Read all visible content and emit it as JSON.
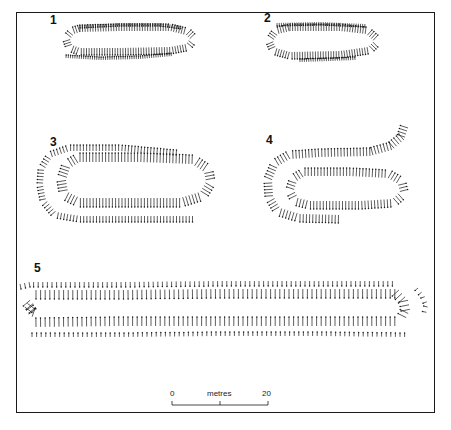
{
  "figures": [
    {
      "label": "1",
      "label_pos": [
        50,
        14
      ]
    },
    {
      "label": "2",
      "label_pos": [
        264,
        12
      ]
    },
    {
      "label": "3",
      "label_pos": [
        50,
        136
      ]
    },
    {
      "label": "4",
      "label_pos": [
        266,
        134
      ]
    },
    {
      "label": "5",
      "label_pos": [
        34,
        262
      ]
    }
  ],
  "scale_bar": {
    "unit_label": "metres",
    "start_label": "0",
    "end_label": "20",
    "x_start": 172,
    "x_end": 268,
    "y": 405
  },
  "stake_rows": [
    {
      "fig": "1",
      "pts": [
        [
          80,
          25
        ],
        [
          120,
          23
        ],
        [
          160,
          23
        ],
        [
          182,
          26
        ]
      ],
      "len": 3,
      "spacing": 2.2,
      "side": 1
    },
    {
      "fig": "1",
      "pts": [
        [
          80,
          32
        ],
        [
          120,
          31
        ],
        [
          170,
          31
        ],
        [
          186,
          35
        ],
        [
          190,
          39
        ],
        [
          186,
          44
        ],
        [
          170,
          47
        ],
        [
          120,
          48
        ],
        [
          80,
          48
        ],
        [
          72,
          45
        ],
        [
          70,
          39
        ],
        [
          74,
          34
        ],
        [
          80,
          32
        ]
      ],
      "len": 7,
      "spacing": 2.6,
      "side": -1
    },
    {
      "fig": "1",
      "pts": [
        [
          66,
          58
        ],
        [
          100,
          60
        ],
        [
          140,
          59
        ],
        [
          172,
          56
        ]
      ],
      "len": 3,
      "spacing": 2.2,
      "side": -1
    },
    {
      "fig": "2",
      "pts": [
        [
          277,
          23
        ],
        [
          320,
          22
        ],
        [
          366,
          24
        ]
      ],
      "len": 3,
      "spacing": 2.2,
      "side": 1
    },
    {
      "fig": "2",
      "pts": [
        [
          290,
          31
        ],
        [
          340,
          31
        ],
        [
          366,
          34
        ],
        [
          374,
          41
        ],
        [
          368,
          47
        ],
        [
          340,
          51
        ],
        [
          290,
          52
        ],
        [
          276,
          48
        ],
        [
          273,
          41
        ],
        [
          278,
          34
        ],
        [
          290,
          31
        ]
      ],
      "len": 7,
      "spacing": 2.6,
      "side": -1
    },
    {
      "fig": "2",
      "pts": [
        [
          300,
          62
        ],
        [
          330,
          61
        ],
        [
          356,
          60
        ]
      ],
      "len": 3,
      "spacing": 2.2,
      "side": -1
    },
    {
      "fig": "3",
      "pts": [
        [
          176,
          156
        ],
        [
          120,
          151
        ],
        [
          70,
          151
        ],
        [
          52,
          157
        ],
        [
          44,
          170
        ],
        [
          43,
          185
        ],
        [
          46,
          200
        ],
        [
          56,
          212
        ],
        [
          80,
          216
        ],
        [
          140,
          216
        ],
        [
          195,
          216
        ]
      ],
      "len": 6,
      "spacing": 3.2,
      "side": 1
    },
    {
      "fig": "3",
      "pts": [
        [
          80,
          162
        ],
        [
          140,
          162
        ],
        [
          192,
          164
        ],
        [
          204,
          172
        ],
        [
          206,
          182
        ],
        [
          200,
          192
        ],
        [
          180,
          198
        ],
        [
          120,
          198
        ],
        [
          80,
          198
        ],
        [
          68,
          192
        ],
        [
          66,
          180
        ],
        [
          70,
          168
        ],
        [
          80,
          162
        ]
      ],
      "len": 9,
      "spacing": 3.2,
      "side": -1
    },
    {
      "fig": "4",
      "pts": [
        [
          408,
          128
        ],
        [
          404,
          140
        ],
        [
          392,
          150
        ],
        [
          370,
          156
        ],
        [
          320,
          157
        ],
        [
          290,
          159
        ],
        [
          278,
          166
        ],
        [
          272,
          180
        ],
        [
          273,
          196
        ],
        [
          280,
          208
        ],
        [
          300,
          214
        ],
        [
          340,
          215
        ]
      ],
      "len": 8,
      "spacing": 3.2,
      "side": 1
    },
    {
      "fig": "4",
      "pts": [
        [
          305,
          176
        ],
        [
          350,
          176
        ],
        [
          388,
          178
        ],
        [
          398,
          184
        ],
        [
          400,
          192
        ],
        [
          392,
          199
        ],
        [
          360,
          201
        ],
        [
          310,
          201
        ],
        [
          298,
          198
        ],
        [
          294,
          190
        ],
        [
          297,
          181
        ],
        [
          305,
          176
        ]
      ],
      "len": 8,
      "spacing": 3.2,
      "side": -1
    },
    {
      "fig": "5",
      "pts": [
        [
          20,
          284
        ],
        [
          30,
          282
        ],
        [
          120,
          282
        ],
        [
          220,
          281
        ],
        [
          320,
          281
        ],
        [
          396,
          281
        ]
      ],
      "len": 5,
      "spacing": 4.6,
      "side": 1
    },
    {
      "fig": "5",
      "pts": [
        [
          36,
          290
        ],
        [
          120,
          290
        ],
        [
          220,
          289
        ],
        [
          320,
          289
        ],
        [
          398,
          289
        ],
        [
          408,
          300
        ],
        [
          410,
          310
        ],
        [
          406,
          318
        ]
      ],
      "len": 9,
      "spacing": 4.6,
      "side": 1
    },
    {
      "fig": "5",
      "pts": [
        [
          36,
          307
        ],
        [
          30,
          300
        ],
        [
          24,
          308
        ],
        [
          30,
          316
        ],
        [
          36,
          318
        ]
      ],
      "len": 9,
      "spacing": 4.5,
      "side": -1
    },
    {
      "fig": "5",
      "pts": [
        [
          36,
          327
        ],
        [
          120,
          326
        ],
        [
          220,
          326
        ],
        [
          320,
          326
        ],
        [
          398,
          326
        ]
      ],
      "len": 9,
      "spacing": 4.6,
      "side": -1
    },
    {
      "fig": "5",
      "pts": [
        [
          32,
          337
        ],
        [
          120,
          337
        ],
        [
          220,
          336
        ],
        [
          320,
          336
        ],
        [
          405,
          337
        ]
      ],
      "len": 4,
      "spacing": 4.6,
      "side": -1
    },
    {
      "fig": "5",
      "pts": [
        [
          418,
          288
        ],
        [
          424,
          295
        ],
        [
          428,
          305
        ],
        [
          426,
          314
        ]
      ],
      "len": 4,
      "spacing": 5.5,
      "side": 1
    }
  ],
  "colors": {
    "ink": "#1a1a1a",
    "paper": "#ffffff"
  }
}
